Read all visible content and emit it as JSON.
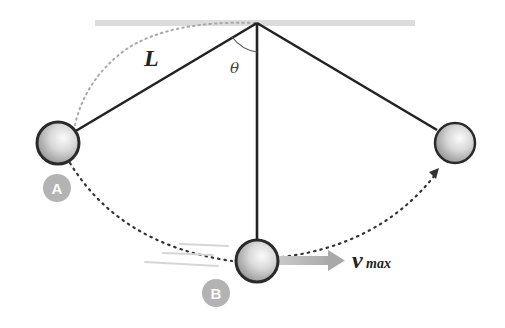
{
  "diagram": {
    "labels": {
      "length": "L",
      "angle": "θ",
      "velocity_main": "v",
      "velocity_sub": "max",
      "point_a": "A",
      "point_b": "B"
    },
    "colors": {
      "ceiling": "#d9d9d9",
      "string": "#222222",
      "bob_fill_light": "#f4f4f4",
      "bob_fill_dark": "#9a9a9a",
      "bob_outline": "#2a2a2a",
      "badge": "#b3b3b3",
      "velocity_arrow": "#b8b8b8",
      "dotted_path": "#333333",
      "dotted_length": "#aaaaaa"
    },
    "geometry": {
      "pivot": [
        257,
        23
      ],
      "bob_left": [
        58,
        143
      ],
      "bob_bottom": [
        257,
        261
      ],
      "bob_right": [
        455,
        143
      ],
      "bob_radius": 21
    }
  }
}
